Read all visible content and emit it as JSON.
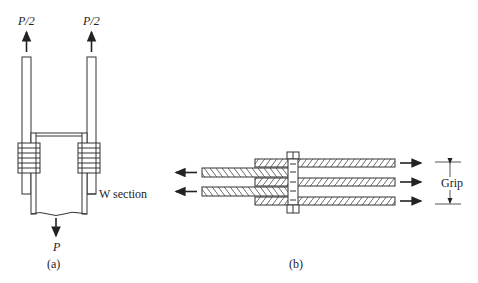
{
  "figure_a": {
    "force_left_top": "P/2",
    "force_right_top": "P/2",
    "force_bottom": "P",
    "member_label": "W section",
    "caption": "(a)"
  },
  "figure_b": {
    "dimension_label": "Grip",
    "caption": "(b)"
  },
  "colors": {
    "line": "#333333",
    "background": "#ffffff"
  }
}
